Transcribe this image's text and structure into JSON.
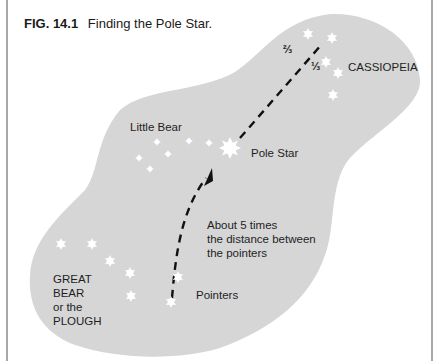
{
  "figure": {
    "number": "FIG. 14.1",
    "title": "Finding the Pole Star."
  },
  "labels": {
    "cassiopeia": "CASSIOPEIA",
    "little_bear": "Little Bear",
    "pole_star": "Pole Star",
    "distance_note": [
      "About 5 times",
      "the distance between",
      "the pointers"
    ],
    "great_bear": [
      "GREAT",
      "BEAR",
      "or the",
      "PLOUGH"
    ],
    "pointers": "Pointers",
    "fraction_two_thirds": "⅔",
    "fraction_one_third": "⅓"
  },
  "colors": {
    "sky_region": "#d6d6d6",
    "stars": "#ffffff",
    "dashed_line": "#111111",
    "frame": "#a8a8a8",
    "text": "#1e1e1e"
  },
  "constellations": {
    "cassiopeia": [
      [
        308,
        34
      ],
      [
        332,
        38
      ],
      [
        326,
        62
      ],
      [
        338,
        73
      ],
      [
        333,
        95
      ]
    ],
    "little_bear": [
      [
        157,
        142
      ],
      [
        189,
        141
      ],
      [
        209,
        143
      ],
      [
        168,
        154
      ],
      [
        139,
        158
      ],
      [
        150,
        169
      ]
    ],
    "pole_star": [
      230,
      148
    ],
    "great_bear": [
      [
        61,
        244
      ],
      [
        92,
        244
      ],
      [
        110,
        261
      ],
      [
        130,
        273
      ],
      [
        131,
        296
      ]
    ],
    "pointers": [
      [
        178,
        277
      ],
      [
        171,
        302
      ]
    ]
  }
}
